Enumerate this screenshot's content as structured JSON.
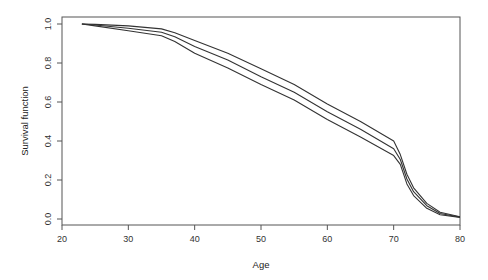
{
  "chart_data": {
    "type": "line",
    "title": "",
    "xlabel": "Age",
    "ylabel": "Survival function",
    "xlim": [
      20,
      80
    ],
    "ylim": [
      0.0,
      1.0
    ],
    "xticks": [
      20,
      30,
      40,
      50,
      60,
      70,
      80
    ],
    "yticks": [
      "0.0",
      "0.2",
      "0.4",
      "0.6",
      "0.8",
      "1.0"
    ],
    "grid": false,
    "legend": null,
    "x": [
      23,
      25,
      30,
      35,
      37,
      40,
      45,
      50,
      55,
      60,
      65,
      70,
      71,
      72,
      73,
      75,
      77,
      80
    ],
    "series": [
      {
        "name": "upper confidence bound",
        "values": [
          1.0,
          0.998,
          0.99,
          0.975,
          0.955,
          0.915,
          0.85,
          0.77,
          0.69,
          0.59,
          0.5,
          0.4,
          0.33,
          0.23,
          0.16,
          0.08,
          0.035,
          0.012
        ]
      },
      {
        "name": "survival estimate",
        "values": [
          1.0,
          0.995,
          0.978,
          0.958,
          0.935,
          0.885,
          0.815,
          0.73,
          0.65,
          0.55,
          0.46,
          0.36,
          0.305,
          0.205,
          0.14,
          0.068,
          0.028,
          0.01
        ]
      },
      {
        "name": "lower confidence bound",
        "values": [
          1.0,
          0.99,
          0.965,
          0.94,
          0.91,
          0.85,
          0.775,
          0.69,
          0.61,
          0.51,
          0.42,
          0.325,
          0.28,
          0.18,
          0.12,
          0.055,
          0.022,
          0.008
        ]
      }
    ]
  }
}
